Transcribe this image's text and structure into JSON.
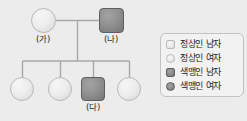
{
  "figure": {
    "type": "pedigree-chart",
    "background_color": "#ececed",
    "line_color": "#a8a8a8",
    "normal_fill": "#e9e9e9",
    "affected_fill": "#8d8d8d"
  },
  "generation1": [
    {
      "id": "g1-mother",
      "label": "(가)",
      "shape": "circle",
      "sex": "female",
      "status": "normal",
      "x": 31,
      "y": 8,
      "size": 25
    },
    {
      "id": "g1-father",
      "label": "(나)",
      "shape": "square",
      "sex": "male",
      "status": "affected",
      "x": 99,
      "y": 8,
      "size": 25
    }
  ],
  "generation2": [
    {
      "id": "g2-child-1",
      "label": "",
      "shape": "circle",
      "sex": "female",
      "status": "normal",
      "x": 10,
      "y": 77,
      "size": 24
    },
    {
      "id": "g2-child-2",
      "label": "",
      "shape": "circle",
      "sex": "female",
      "status": "normal",
      "x": 48,
      "y": 77,
      "size": 24
    },
    {
      "id": "g2-child-3",
      "label": "(다)",
      "shape": "square",
      "sex": "male",
      "status": "affected",
      "x": 81,
      "y": 77,
      "size": 24
    },
    {
      "id": "g2-child-4",
      "label": "",
      "shape": "circle",
      "sex": "female",
      "status": "normal",
      "x": 117,
      "y": 77,
      "size": 24
    }
  ],
  "labels": {
    "parent_female": "(가)",
    "parent_male": "(나)",
    "child_male": "(다)"
  },
  "legend": {
    "items": [
      {
        "marker": "square",
        "status": "normal",
        "text": "정상인 남자"
      },
      {
        "marker": "circle",
        "status": "normal",
        "text": "정상인 여자"
      },
      {
        "marker": "square",
        "status": "affected",
        "text": "색맹인 남자"
      },
      {
        "marker": "circle",
        "status": "affected",
        "text": "색맹인 여자"
      }
    ]
  }
}
